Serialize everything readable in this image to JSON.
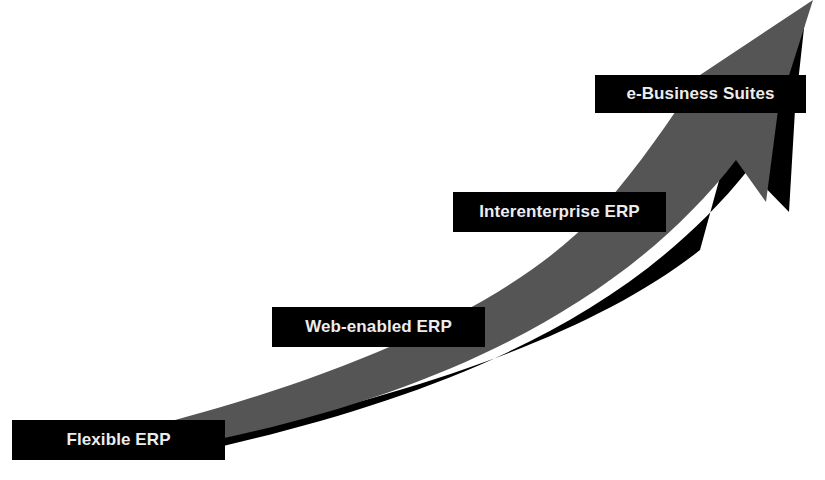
{
  "diagram": {
    "type": "curved-progression-arrow",
    "colors": {
      "arrow_fill": "#545454",
      "arrow_shadow": "#000000",
      "label_bg": "#000000",
      "label_text": "#ececec",
      "background": "#ffffff"
    },
    "stages": [
      {
        "label": "Flexible ERP"
      },
      {
        "label": "Web-enabled ERP"
      },
      {
        "label": "Interenterprise ERP"
      },
      {
        "label": "e-Business Suites"
      }
    ]
  }
}
